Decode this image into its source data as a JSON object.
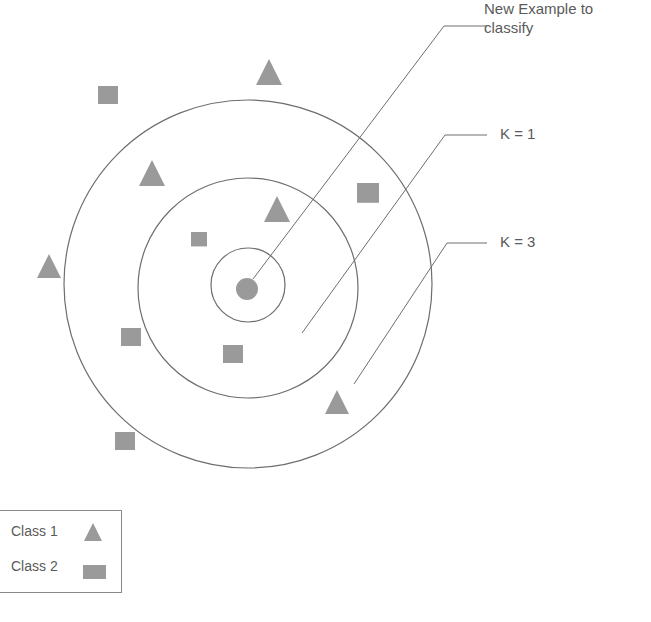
{
  "diagram": {
    "type": "k-nearest-neighbors illustration",
    "colors": {
      "shape_fill": "#9a9a9a",
      "line": "#6e6e6e",
      "text": "#5a5a5a",
      "background": "#ffffff"
    },
    "query_point": {
      "label": "New Example to classify",
      "shape": "circle",
      "cx": 247,
      "cy": 289,
      "r": 11
    },
    "circles": [
      {
        "name": "inner",
        "cx": 248,
        "cy": 285,
        "r": 37
      },
      {
        "name": "k1",
        "label": "K = 1",
        "cx": 248,
        "cy": 288,
        "r": 110
      },
      {
        "name": "k3",
        "label": "K = 3",
        "cx": 248,
        "cy": 284,
        "r": 184
      }
    ],
    "callouts": [
      {
        "text_line1": "New Example to",
        "text_line2": "classify",
        "x1": 253,
        "y1": 279,
        "x2": 444,
        "y2": 26,
        "x3": 487,
        "y3": 26
      },
      {
        "text_line1": "K = 1",
        "x1": 302,
        "y1": 333,
        "x2": 445,
        "y2": 135,
        "x3": 487,
        "y3": 135
      },
      {
        "text_line1": "K = 3",
        "x1": 354,
        "y1": 384,
        "x2": 447,
        "y2": 243,
        "x3": 487,
        "y3": 243
      }
    ],
    "points": [
      {
        "class": "Class 1",
        "shape": "triangle",
        "x": 269,
        "y": 72,
        "size": 26
      },
      {
        "class": "Class 1",
        "shape": "triangle",
        "x": 152,
        "y": 173,
        "size": 26
      },
      {
        "class": "Class 1",
        "shape": "triangle",
        "x": 277,
        "y": 209,
        "size": 26
      },
      {
        "class": "Class 1",
        "shape": "triangle",
        "x": 49,
        "y": 266,
        "size": 24
      },
      {
        "class": "Class 1",
        "shape": "triangle",
        "x": 337,
        "y": 402,
        "size": 24
      },
      {
        "class": "Class 2",
        "shape": "square",
        "x": 108,
        "y": 96,
        "size": 20
      },
      {
        "class": "Class 2",
        "shape": "square",
        "x": 368,
        "y": 194,
        "size": 22
      },
      {
        "class": "Class 2",
        "shape": "square",
        "x": 199,
        "y": 240,
        "size": 16
      },
      {
        "class": "Class 2",
        "shape": "square",
        "x": 131,
        "y": 338,
        "size": 20
      },
      {
        "class": "Class 2",
        "shape": "square",
        "x": 233,
        "y": 355,
        "size": 20
      },
      {
        "class": "Class 2",
        "shape": "square",
        "x": 125,
        "y": 442,
        "size": 20
      }
    ]
  },
  "labels": {
    "new_example_line1": "New Example to",
    "new_example_line2": "classify",
    "k1": "K = 1",
    "k3": "K = 3"
  },
  "legend": {
    "items": [
      {
        "label": "Class 1",
        "icon": "triangle-icon"
      },
      {
        "label": "Class 2",
        "icon": "square-icon"
      }
    ]
  }
}
